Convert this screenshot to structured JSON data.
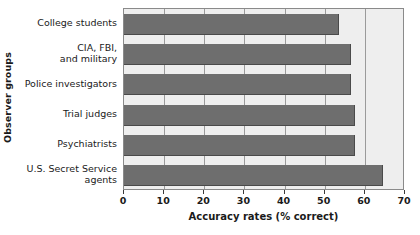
{
  "chart_data": {
    "type": "bar",
    "orientation": "horizontal",
    "title": "",
    "xlabel": "Accuracy rates (% correct)",
    "ylabel": "Observer groups",
    "categories": [
      "College students",
      "CIA, FBI,\nand military",
      "Police investigators",
      "Trial judges",
      "Psychiatrists",
      "U.S. Secret Service\nagents"
    ],
    "values": [
      53.5,
      56.5,
      56.5,
      57.5,
      57.5,
      64.5
    ],
    "xlim": [
      0,
      70
    ],
    "xticks": [
      0,
      10,
      20,
      30,
      40,
      50,
      60,
      70
    ],
    "xtick_labels": [
      "0",
      "10",
      "20",
      "30",
      "40",
      "50",
      "60",
      "70"
    ],
    "grid": true,
    "grid_axis": "x",
    "legend": false,
    "bar_color": "#6e6e6e",
    "bar_edge_color": "#4a4a4a",
    "plot_background": "#eeeeee",
    "gridline_color": "#9a9a9a",
    "axis_border_color": "#8a8a8a"
  }
}
